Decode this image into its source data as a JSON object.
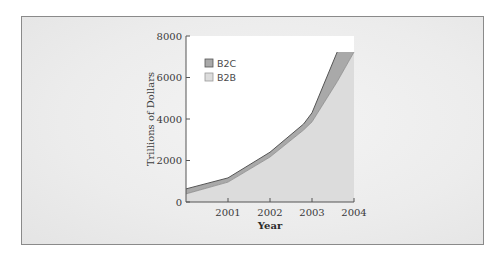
{
  "chart_data": {
    "type": "area",
    "stacked": true,
    "title": "",
    "xlabel": "Year",
    "ylabel": "Trillions of Dollars",
    "ylim": [
      0,
      8000
    ],
    "yticks": [
      0,
      2000,
      4000,
      6000,
      8000
    ],
    "xticks": [
      "2001",
      "2002",
      "2003",
      "2004"
    ],
    "x": [
      2000.0,
      2001.0,
      2002.0,
      2002.8,
      2003.0,
      2003.6,
      2004.0
    ],
    "series": [
      {
        "name": "B2B",
        "values": [
          390,
          960,
          2170,
          3470,
          3860,
          5800,
          7230
        ],
        "color": "#dcdcdc"
      },
      {
        "name": "B2C",
        "values": [
          630,
          1160,
          2400,
          3760,
          4300,
          7230,
          7230
        ],
        "color": "#a9a9a9",
        "note": "top (cumulative) boundary"
      }
    ],
    "legend": {
      "position": "upper-left-inside",
      "entries": [
        "B2C",
        "B2B"
      ]
    },
    "grid": false
  },
  "legend": {
    "b2c": "B2C",
    "b2b": "B2B"
  },
  "axes": {
    "ylabel": "Trillions of Dollars",
    "xlabel": "Year",
    "ytick_labels": [
      "0",
      "2000",
      "4000",
      "6000",
      "8000"
    ],
    "xtick_labels": [
      "2001",
      "2002",
      "2003",
      "2004"
    ]
  },
  "colors": {
    "b2c_fill": "#a9a9a9",
    "b2b_fill": "#dcdcdc",
    "line": "#555555",
    "frame_bg": "#ececec"
  }
}
